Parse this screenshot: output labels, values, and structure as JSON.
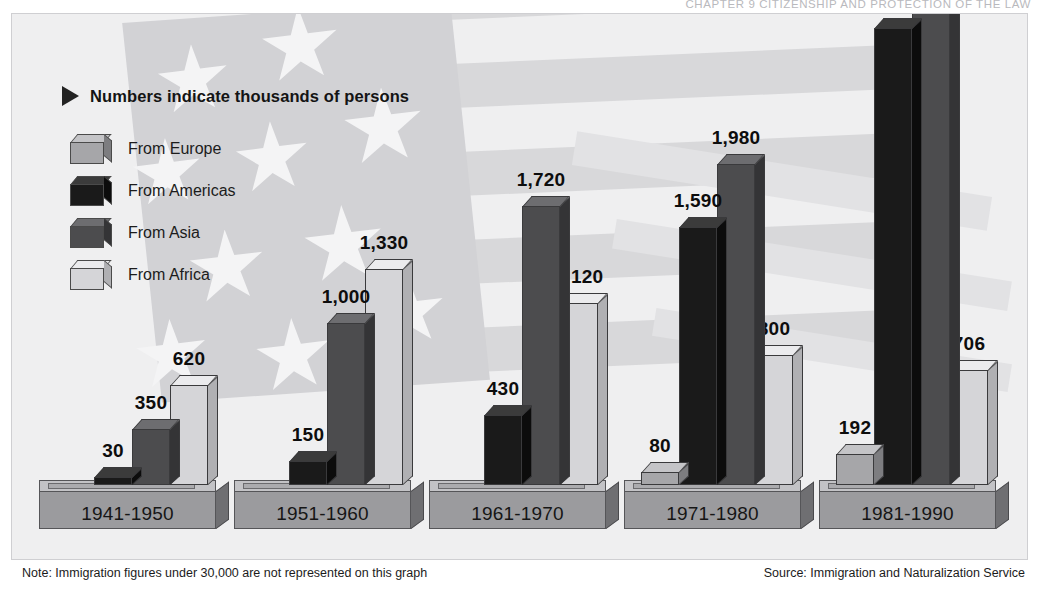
{
  "running_head": "CHAPTER 9   CITIZENSHIP AND PROTECTION OF THE LAW",
  "legend": {
    "title": "Numbers indicate thousands of persons",
    "bullet_icon": "triangle-right-icon",
    "items": [
      {
        "label": "From Europe",
        "key": "europe",
        "color": "#a6a6a9",
        "top": "#c4c4c7",
        "side": "#7d7d80"
      },
      {
        "label": "From Americas",
        "key": "americas",
        "color": "#1a1a1a",
        "top": "#3b3b3b",
        "side": "#0c0c0c"
      },
      {
        "label": "From Asia",
        "key": "asia",
        "color": "#4c4c4e",
        "top": "#6d6d70",
        "side": "#343436"
      },
      {
        "label": "From Africa",
        "key": "africa",
        "color": "#d5d5d8",
        "top": "#ebebed",
        "side": "#b0b0b3"
      }
    ]
  },
  "footer": {
    "note": "Note: Immigration figures under 30,000 are not represented on this graph",
    "source": "Source: Immigration and Naturalization Service"
  },
  "chart_data": {
    "type": "bar",
    "title": "Numbers indicate thousands of persons",
    "xlabel": "",
    "ylabel": "Thousands of persons",
    "unit": "thousands of persons",
    "categories": [
      "1941-1950",
      "1951-1960",
      "1961-1970",
      "1971-1980",
      "1981-1990"
    ],
    "series": [
      {
        "name": "From Europe",
        "values": [
          null,
          null,
          null,
          80,
          192
        ]
      },
      {
        "name": "From Americas",
        "values": [
          30,
          150,
          430,
          1590,
          2817
        ]
      },
      {
        "name": "From Asia",
        "values": [
          350,
          1000,
          1720,
          1980,
          3581
        ]
      },
      {
        "name": "From Africa",
        "values": [
          620,
          1330,
          1120,
          800,
          706
        ]
      }
    ],
    "value_labels": {
      "1941-1950": [
        "30",
        "350",
        "620"
      ],
      "1951-1960": [
        "150",
        "1,000",
        "1,330"
      ],
      "1961-1970": [
        "430",
        "1,720",
        "1,120"
      ],
      "1971-1980": [
        "80",
        "1,590",
        "1,980",
        "800"
      ],
      "1981-1990": [
        "192",
        "2,817",
        "3,581",
        "706"
      ]
    },
    "ylim": [
      0,
      3581
    ],
    "grid": false,
    "legend_position": "upper-left"
  },
  "groups": [
    {
      "label": "1941-1950",
      "left": 27,
      "width": 177,
      "bars": [
        {
          "series": "americas",
          "value": 30,
          "text": "30",
          "left": 55,
          "width": 38,
          "height": 8
        },
        {
          "series": "asia",
          "value": 350,
          "text": "350",
          "left": 93,
          "width": 38,
          "height": 56
        },
        {
          "series": "africa",
          "value": 620,
          "text": "620",
          "left": 131,
          "width": 38,
          "height": 100
        }
      ]
    },
    {
      "label": "1951-1960",
      "left": 222,
      "width": 177,
      "bars": [
        {
          "series": "americas",
          "value": 150,
          "text": "150",
          "left": 55,
          "width": 38,
          "height": 24
        },
        {
          "series": "asia",
          "value": 1000,
          "text": "1,000",
          "left": 93,
          "width": 38,
          "height": 162
        },
        {
          "series": "africa",
          "value": 1330,
          "text": "1,330",
          "left": 131,
          "width": 38,
          "height": 216
        }
      ]
    },
    {
      "label": "1961-1970",
      "left": 417,
      "width": 177,
      "bars": [
        {
          "series": "americas",
          "value": 430,
          "text": "430",
          "left": 55,
          "width": 38,
          "height": 70
        },
        {
          "series": "asia",
          "value": 1720,
          "text": "1,720",
          "left": 93,
          "width": 38,
          "height": 279
        },
        {
          "series": "africa",
          "value": 1120,
          "text": "1,120",
          "left": 131,
          "width": 38,
          "height": 182
        }
      ]
    },
    {
      "label": "1971-1980",
      "left": 612,
      "width": 177,
      "bars": [
        {
          "series": "europe",
          "value": 80,
          "text": "80",
          "left": 17,
          "width": 38,
          "height": 13
        },
        {
          "series": "americas",
          "value": 1590,
          "text": "1,590",
          "left": 55,
          "width": 38,
          "height": 258
        },
        {
          "series": "asia",
          "value": 1980,
          "text": "1,980",
          "left": 93,
          "width": 38,
          "height": 321
        },
        {
          "series": "africa",
          "value": 800,
          "text": "800",
          "left": 131,
          "width": 38,
          "height": 130
        }
      ]
    },
    {
      "label": "1981-1990",
      "left": 807,
      "width": 177,
      "bars": [
        {
          "series": "europe",
          "value": 192,
          "text": "192",
          "left": 17,
          "width": 38,
          "height": 31
        },
        {
          "series": "americas",
          "value": 2817,
          "text": "2,817",
          "left": 55,
          "width": 38,
          "height": 457
        },
        {
          "series": "asia",
          "value": 3581,
          "text": "3,581",
          "left": 93,
          "width": 38,
          "height": 490
        },
        {
          "series": "africa",
          "value": 706,
          "text": "706",
          "left": 131,
          "width": 38,
          "height": 115
        }
      ]
    }
  ]
}
